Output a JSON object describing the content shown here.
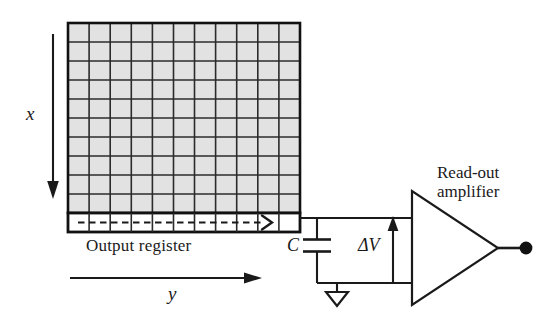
{
  "figure": {
    "type": "ccd-sensor-readout-schematic",
    "background_color": "#ffffff",
    "line_color": "#1a1a1a",
    "pixel_fill_color": "#e2e2e2",
    "pixel_stroke_color": "#2b2b2b"
  },
  "sensor_array": {
    "name": "pixel-array",
    "columns": 11,
    "rows": 10,
    "fill_color": "#e2e2e2",
    "grid_line_color": "#2b2b2b",
    "border_color": "#111111"
  },
  "output_register": {
    "label": "Output register",
    "cells": 11,
    "fill_color": "#ffffff",
    "border_color": "#111111",
    "transfer_arrow": "dashed-right-arrow"
  },
  "axes": {
    "x": {
      "label": "x",
      "direction": "down",
      "arrow": "arrow-down"
    },
    "y": {
      "label": "y",
      "direction": "right",
      "arrow": "arrow-right"
    }
  },
  "circuit": {
    "capacitor": {
      "label": "C",
      "symbol": "capacitor-parallel-plates"
    },
    "ground": {
      "symbol": "ground-triangle"
    },
    "voltage": {
      "label": "ΔV",
      "arrow": "arrow-up"
    },
    "amplifier": {
      "label_line1": "Read-out",
      "label_line2": "amplifier",
      "symbol": "triangle-amplifier"
    },
    "output_node": {
      "symbol": "filled-dot"
    }
  }
}
